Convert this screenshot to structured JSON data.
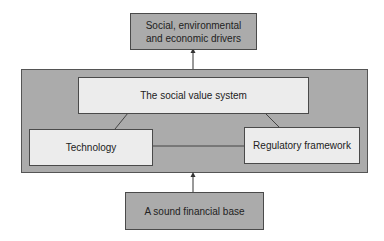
{
  "diagram": {
    "top_box": {
      "label_line1": "Social, environmental",
      "label_line2": "and economic drivers"
    },
    "center_box": {
      "label": "The social value system"
    },
    "left_box": {
      "label": "Technology"
    },
    "right_box": {
      "label": "Regulatory framework"
    },
    "bottom_box": {
      "label": "A sound financial base"
    },
    "colors": {
      "dark_fill": "#ababab",
      "light_fill": "#ececec",
      "border": "#4a4a4a"
    },
    "edges": [
      {
        "from": "outer_group",
        "to": "top_box",
        "arrow": true
      },
      {
        "from": "bottom_box",
        "to": "outer_group",
        "arrow": true
      },
      {
        "from": "center_box",
        "to": "left_box",
        "arrow": false
      },
      {
        "from": "center_box",
        "to": "right_box",
        "arrow": false
      },
      {
        "from": "left_box",
        "to": "right_box",
        "arrow": false
      }
    ]
  }
}
